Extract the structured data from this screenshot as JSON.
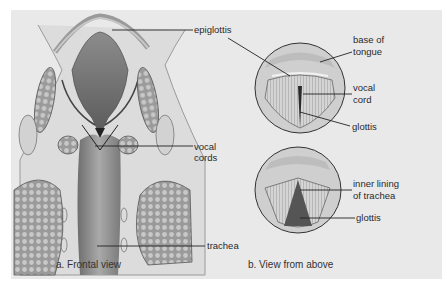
{
  "figure": {
    "panel_background": "#e9e9e9",
    "panels": [
      {
        "id": "a",
        "caption": "a. Frontal view",
        "labels": {
          "epiglottis": "epiglottis",
          "vocal_cords_line1": "vocal",
          "vocal_cords_line2": "cords",
          "trachea": "trachea"
        }
      },
      {
        "id": "b",
        "caption": "b. View from above",
        "top_view": {
          "base_of_tongue_line1": "base of",
          "base_of_tongue_line2": "tongue",
          "vocal_cord_line1": "vocal",
          "vocal_cord_line2": "cord",
          "glottis": "glottis"
        },
        "bottom_view": {
          "inner_lining_line1": "inner lining",
          "inner_lining_line2": "of trachea",
          "glottis": "glottis"
        }
      }
    ]
  }
}
